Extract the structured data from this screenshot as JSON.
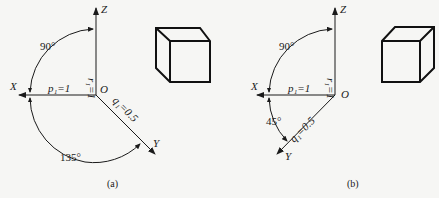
{
  "figure": {
    "panels": [
      {
        "id": "a",
        "caption": "(a)",
        "axes": {
          "x": "X",
          "y": "Y",
          "z": "Z",
          "origin": "O"
        },
        "coefficients": {
          "p": "p₁=1",
          "q": "q₁=0.5",
          "r": "r₁=1"
        },
        "angles": {
          "xz": "90°",
          "xy": "135°"
        },
        "projection": "oblique (cabinet) — Y axis at 45° below horizontal to the right",
        "shape": "cube"
      },
      {
        "id": "b",
        "caption": "(b)",
        "axes": {
          "x": "X",
          "y": "Y",
          "z": "Z",
          "origin": "O"
        },
        "coefficients": {
          "p": "p₁=1",
          "q": "q₁=0.5",
          "r": "r₁=1"
        },
        "angles": {
          "xz": "90°",
          "xy": "45°"
        },
        "projection": "oblique (cabinet) — Y axis at 45° below horizontal to the left",
        "shape": "cube"
      }
    ]
  }
}
